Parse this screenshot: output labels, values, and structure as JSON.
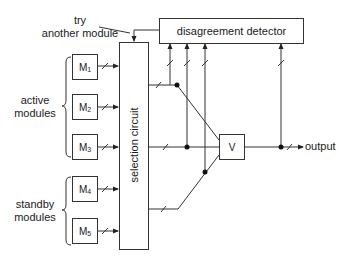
{
  "diagram": {
    "title_note": "try another module",
    "note_line1": "try",
    "note_line2": "another module",
    "detector_label": "disagreement detector",
    "selector_label": "selection circuit",
    "voter_label": "V",
    "output_label": "output",
    "group_active": {
      "line1": "active",
      "line2": "modules"
    },
    "group_standby": {
      "line1": "standby",
      "line2": "modules"
    },
    "modules": [
      {
        "name": "M",
        "sub": "1"
      },
      {
        "name": "M",
        "sub": "2"
      },
      {
        "name": "M",
        "sub": "3"
      },
      {
        "name": "M",
        "sub": "4"
      },
      {
        "name": "M",
        "sub": "5"
      }
    ],
    "line_color": "#333333"
  }
}
